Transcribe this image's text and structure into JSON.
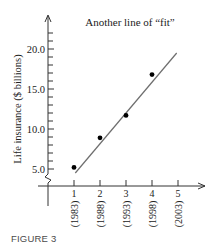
{
  "chart_data": {
    "type": "scatter",
    "title": "Another line of “fit”",
    "xlabel": "",
    "ylabel": "Life insurance ($ billions)",
    "x_ticks": [
      "1",
      "2",
      "3",
      "4",
      "5"
    ],
    "x_tick_years": [
      "(1983)",
      "(1988)",
      "(1993)",
      "(1998)",
      "(2003)"
    ],
    "y_ticks": [
      "5.0",
      "10.0",
      "15.0",
      "20.0"
    ],
    "y_minor_tick_step": 1,
    "ylim": [
      2,
      24
    ],
    "xlim": [
      0,
      6
    ],
    "y_axis_break": true,
    "grid": false,
    "legend": null,
    "series": [
      {
        "name": "data points",
        "kind": "scatter",
        "x": [
          1,
          2,
          3,
          4
        ],
        "y": [
          5.2,
          8.9,
          11.7,
          16.8
        ]
      },
      {
        "name": "line of fit",
        "kind": "line",
        "x": [
          1.05,
          4.95
        ],
        "y": [
          4.5,
          19.5
        ]
      }
    ],
    "colors": {
      "axis": "#333333",
      "points": "#000000",
      "fit_line": "#6e6e6e"
    }
  },
  "caption": "FIGURE 3"
}
